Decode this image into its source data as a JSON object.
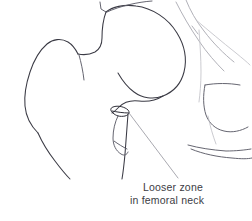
{
  "figure": {
    "kind": "medical-line-drawing",
    "background_color": "#ffffff",
    "width": 252,
    "height": 221
  },
  "annotation": {
    "label_line_1": "Looser zone",
    "label_line_2": "in femoral neck",
    "text_color": "#3c3c44",
    "leader_color": "#9a9aa2"
  },
  "linework": {
    "dark_color": "#3a3a44",
    "mid_color": "#5d5d68",
    "light_color": "#a8a8b0",
    "faint_color": "#c2c2c8",
    "lesion_color": "#2e2e38"
  },
  "structures": [
    {
      "name": "femoral-head",
      "shade": "dark"
    },
    {
      "name": "greater-trochanter",
      "shade": "dark"
    },
    {
      "name": "femoral-neck",
      "shade": "dark"
    },
    {
      "name": "femoral-shaft-lateral",
      "shade": "dark"
    },
    {
      "name": "femoral-shaft-medial",
      "shade": "dark"
    },
    {
      "name": "lesser-trochanter",
      "shade": "mid"
    },
    {
      "name": "acetabular-roof",
      "shade": "light"
    },
    {
      "name": "pelvic-brim",
      "shade": "light"
    },
    {
      "name": "obturator-foramen",
      "shade": "mid"
    },
    {
      "name": "superior-pubic-ramus",
      "shade": "mid"
    },
    {
      "name": "inferior-pubic-ramus",
      "shade": "mid"
    },
    {
      "name": "looser-zone-lesion",
      "shade": "lesion"
    }
  ]
}
